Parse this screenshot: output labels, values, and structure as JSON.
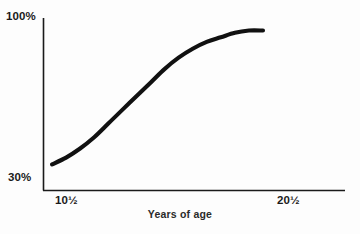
{
  "chart_data": {
    "type": "line",
    "title": "",
    "xlabel": "Years of age",
    "ylabel": "",
    "y_tick_labels": [
      "100%",
      "30%"
    ],
    "x_tick_labels": [
      "10½",
      "20½"
    ],
    "ylim": [
      30,
      100
    ],
    "xlim": [
      10.5,
      20.5
    ],
    "grid": false,
    "legend": false,
    "series": [
      {
        "name": "percent",
        "x": [
          10.5,
          11.0,
          11.5,
          12.0,
          12.5,
          13.0,
          13.5,
          14.0,
          14.5,
          15.0,
          15.5,
          16.0,
          16.5,
          17.0,
          17.5,
          18.0
        ],
        "values": [
          36,
          39,
          43,
          48,
          54,
          60,
          66,
          72,
          78,
          83,
          87,
          90,
          92,
          94,
          95,
          95
        ]
      }
    ],
    "curve_color": "#111111",
    "axis_color": "#1a1a1a",
    "background": "#fdfdfd"
  },
  "axes": {
    "y_top_label": "100%",
    "y_bottom_label": "30%",
    "x_left_label": "10½",
    "x_right_label": "20½",
    "x_axis_title": "Years of age"
  }
}
